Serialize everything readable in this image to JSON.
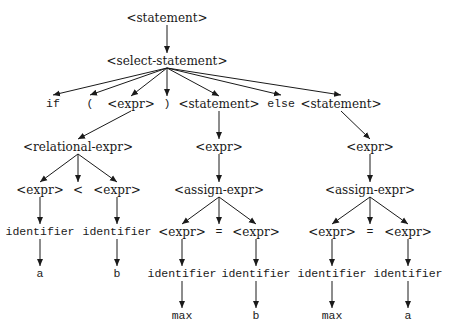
{
  "diagram": {
    "type": "parse-tree",
    "nodes": [
      {
        "id": "n0",
        "label": "<statement>",
        "kind": "nonterminal",
        "x": 167,
        "y": 18
      },
      {
        "id": "n1",
        "label": "<select-statement>",
        "kind": "nonterminal",
        "x": 167,
        "y": 61
      },
      {
        "id": "n2",
        "label": "if",
        "kind": "terminal",
        "x": 53,
        "y": 104
      },
      {
        "id": "n3",
        "label": "(",
        "kind": "terminal",
        "x": 90,
        "y": 104
      },
      {
        "id": "n4",
        "label": "<expr>",
        "kind": "nonterminal",
        "x": 131,
        "y": 104
      },
      {
        "id": "n5",
        "label": ")",
        "kind": "terminal",
        "x": 167,
        "y": 104
      },
      {
        "id": "n6",
        "label": "<statement>",
        "kind": "nonterminal",
        "x": 219,
        "y": 104
      },
      {
        "id": "n7",
        "label": "else",
        "kind": "terminal",
        "x": 281,
        "y": 104
      },
      {
        "id": "n8",
        "label": "<statement>",
        "kind": "nonterminal",
        "x": 341,
        "y": 104
      },
      {
        "id": "n9",
        "label": "<relational-expr>",
        "kind": "nonterminal",
        "x": 78,
        "y": 147
      },
      {
        "id": "n10",
        "label": "<expr>",
        "kind": "nonterminal",
        "x": 219,
        "y": 147
      },
      {
        "id": "n11",
        "label": "<expr>",
        "kind": "nonterminal",
        "x": 370,
        "y": 147
      },
      {
        "id": "n12",
        "label": "<expr>",
        "kind": "nonterminal",
        "x": 40,
        "y": 190
      },
      {
        "id": "n13",
        "label": "<",
        "kind": "nonterminal",
        "x": 78,
        "y": 190
      },
      {
        "id": "n14",
        "label": "<expr>",
        "kind": "nonterminal",
        "x": 117,
        "y": 190
      },
      {
        "id": "n15",
        "label": "<assign-expr>",
        "kind": "nonterminal",
        "x": 219,
        "y": 190
      },
      {
        "id": "n16",
        "label": "<assign-expr>",
        "kind": "nonterminal",
        "x": 370,
        "y": 190
      },
      {
        "id": "n17",
        "label": "identifier",
        "kind": "terminal",
        "x": 40,
        "y": 232
      },
      {
        "id": "n18",
        "label": "identifier",
        "kind": "terminal",
        "x": 117,
        "y": 232
      },
      {
        "id": "n19",
        "label": "<expr>",
        "kind": "nonterminal",
        "x": 182,
        "y": 232
      },
      {
        "id": "n20",
        "label": "=",
        "kind": "terminal",
        "x": 219,
        "y": 232
      },
      {
        "id": "n21",
        "label": "<expr>",
        "kind": "nonterminal",
        "x": 256,
        "y": 232
      },
      {
        "id": "n22",
        "label": "<expr>",
        "kind": "nonterminal",
        "x": 332,
        "y": 232
      },
      {
        "id": "n23",
        "label": "=",
        "kind": "terminal",
        "x": 370,
        "y": 232
      },
      {
        "id": "n24",
        "label": "<expr>",
        "kind": "nonterminal",
        "x": 408,
        "y": 232
      },
      {
        "id": "n25",
        "label": "a",
        "kind": "terminal",
        "x": 40,
        "y": 274
      },
      {
        "id": "n26",
        "label": "b",
        "kind": "terminal",
        "x": 117,
        "y": 274
      },
      {
        "id": "n27",
        "label": "identifier",
        "kind": "terminal",
        "x": 182,
        "y": 274
      },
      {
        "id": "n28",
        "label": "identifier",
        "kind": "terminal",
        "x": 256,
        "y": 274
      },
      {
        "id": "n29",
        "label": "identifier",
        "kind": "terminal",
        "x": 332,
        "y": 274
      },
      {
        "id": "n30",
        "label": "identifier",
        "kind": "terminal",
        "x": 408,
        "y": 274
      },
      {
        "id": "n31",
        "label": "max",
        "kind": "terminal",
        "x": 182,
        "y": 316
      },
      {
        "id": "n32",
        "label": "b",
        "kind": "terminal",
        "x": 256,
        "y": 316
      },
      {
        "id": "n33",
        "label": "max",
        "kind": "terminal",
        "x": 332,
        "y": 316
      },
      {
        "id": "n34",
        "label": "a",
        "kind": "terminal",
        "x": 408,
        "y": 316
      }
    ],
    "edges": [
      [
        "n0",
        "n1"
      ],
      [
        "n1",
        "n2"
      ],
      [
        "n1",
        "n3"
      ],
      [
        "n1",
        "n4"
      ],
      [
        "n1",
        "n5"
      ],
      [
        "n1",
        "n6"
      ],
      [
        "n1",
        "n7"
      ],
      [
        "n1",
        "n8"
      ],
      [
        "n4",
        "n9"
      ],
      [
        "n6",
        "n10"
      ],
      [
        "n8",
        "n11"
      ],
      [
        "n9",
        "n12"
      ],
      [
        "n9",
        "n13"
      ],
      [
        "n9",
        "n14"
      ],
      [
        "n10",
        "n15"
      ],
      [
        "n11",
        "n16"
      ],
      [
        "n12",
        "n17"
      ],
      [
        "n14",
        "n18"
      ],
      [
        "n15",
        "n19"
      ],
      [
        "n15",
        "n20"
      ],
      [
        "n15",
        "n21"
      ],
      [
        "n16",
        "n22"
      ],
      [
        "n16",
        "n23"
      ],
      [
        "n16",
        "n24"
      ],
      [
        "n17",
        "n25"
      ],
      [
        "n18",
        "n26"
      ],
      [
        "n19",
        "n27"
      ],
      [
        "n21",
        "n28"
      ],
      [
        "n22",
        "n29"
      ],
      [
        "n24",
        "n30"
      ],
      [
        "n27",
        "n31"
      ],
      [
        "n28",
        "n32"
      ],
      [
        "n29",
        "n33"
      ],
      [
        "n30",
        "n34"
      ]
    ],
    "colors": {
      "line": "#1a1a1a",
      "text": "#1a1a1a",
      "background": "#ffffff"
    }
  }
}
